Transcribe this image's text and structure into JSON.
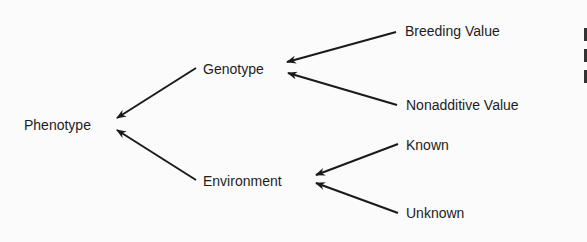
{
  "diagram": {
    "type": "tree",
    "direction": "right-to-left",
    "nodes": [
      {
        "id": "phenotype",
        "label": "Phenotype"
      },
      {
        "id": "genotype",
        "label": "Genotype"
      },
      {
        "id": "environment",
        "label": "Environment"
      },
      {
        "id": "breeding_value",
        "label": "Breeding Value"
      },
      {
        "id": "nonadditive_value",
        "label": "Nonadditive Value"
      },
      {
        "id": "known",
        "label": "Known"
      },
      {
        "id": "unknown",
        "label": "Unknown"
      }
    ],
    "edges": [
      {
        "from": "genotype",
        "to": "phenotype"
      },
      {
        "from": "environment",
        "to": "phenotype"
      },
      {
        "from": "breeding_value",
        "to": "genotype"
      },
      {
        "from": "nonadditive_value",
        "to": "genotype"
      },
      {
        "from": "known",
        "to": "environment"
      },
      {
        "from": "unknown",
        "to": "environment"
      }
    ]
  },
  "labels": {
    "phenotype": "Phenotype",
    "genotype": "Genotype",
    "environment": "Environment",
    "breeding_value": "Breeding Value",
    "nonadditive_value": "Nonadditive Value",
    "known": "Known",
    "unknown": "Unknown"
  },
  "colors": {
    "text": "#1d1d1d",
    "arrow": "#1a1a1a",
    "background": "#fbfbfb"
  }
}
